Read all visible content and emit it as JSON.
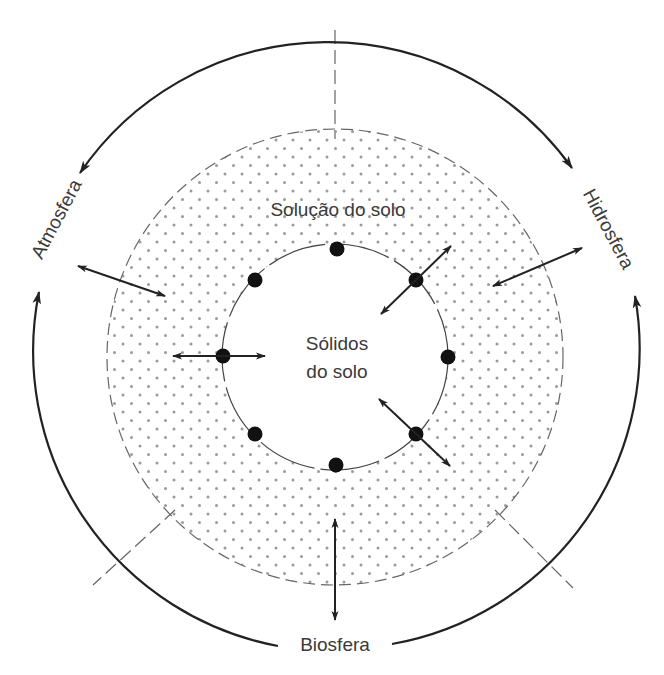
{
  "diagram": {
    "type": "soil system exchange diagram",
    "colors": {
      "line": "#222222",
      "dashed_line": "#666666",
      "dot_pattern": "#9a9a9a",
      "particle": "#111111",
      "text": "#3a3a3a",
      "background": "#ffffff"
    },
    "center_labels": {
      "solids_line1": "Sólidos",
      "solids_line2": "do solo",
      "solution": "Solução do solo"
    },
    "outer_labels": {
      "atmosphere": "Atmosfera",
      "hydrosphere": "Hidrosfera",
      "biosphere": "Biosfera"
    },
    "regions": [
      {
        "name": "Sólidos do solo",
        "shape": "inner circle",
        "fill": "white"
      },
      {
        "name": "Solução do solo",
        "shape": "dotted ring",
        "fill": "dot pattern"
      }
    ],
    "particles_on_inner_circle": 8,
    "exchange_arrows": [
      {
        "from": "Atmosfera",
        "to": "Solução do solo",
        "bidirectional": true
      },
      {
        "from": "Hidrosfera",
        "to": "Solução do solo",
        "bidirectional": true
      },
      {
        "from": "Biosfera",
        "to": "Solução do solo",
        "bidirectional": true
      },
      {
        "from": "Sólidos do solo",
        "to": "Solução do solo",
        "bidirectional": true,
        "count": 3
      }
    ],
    "cycle_arrows": [
      {
        "from": "Hidrosfera",
        "to": "Atmosfera",
        "path": "top arc"
      },
      {
        "from": "Biosfera",
        "to": "Atmosfera",
        "path": "left arc"
      },
      {
        "from": "Biosfera",
        "to": "Hidrosfera",
        "path": "right arc"
      }
    ]
  }
}
